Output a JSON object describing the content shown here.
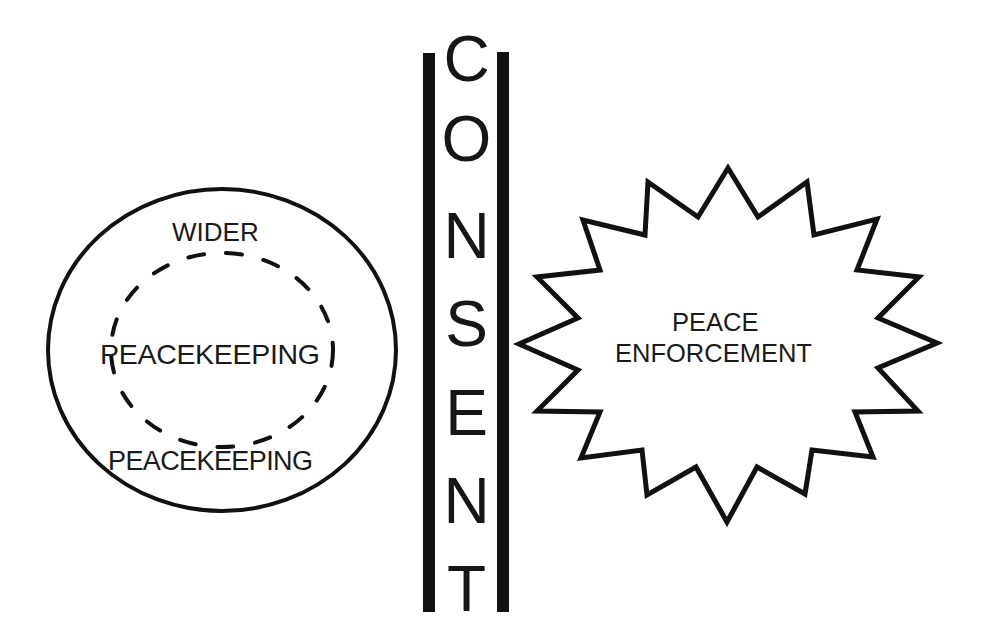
{
  "diagram": {
    "left_region": {
      "shape": "circle",
      "outer_label_top": "WIDER",
      "inner_label": "PEACEKEEPING",
      "outer_label_bottom": "PEACEKEEPING",
      "inner_boundary": "dashed-ellipse"
    },
    "divider": {
      "label": "CONSENT",
      "letters": [
        "C",
        "O",
        "N",
        "S",
        "E",
        "N",
        "T"
      ],
      "orientation": "vertical"
    },
    "right_region": {
      "shape": "starburst",
      "label_line1": "PEACE",
      "label_line2": "ENFORCEMENT"
    },
    "colors": {
      "ink": "#111111",
      "background": "#ffffff"
    }
  }
}
